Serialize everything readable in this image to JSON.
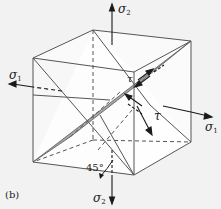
{
  "figure": {
    "panel_label": "(b)",
    "colors": {
      "background": "#f2f2f2",
      "edges": "#555555",
      "shaded_plane": "#a6a6a6",
      "face_light": "#ffffff"
    }
  },
  "labels": {
    "sigma2_top": {
      "symbol": "σ",
      "sub": "2"
    },
    "sigma1_left": {
      "symbol": "σ",
      "sub": "1"
    },
    "sigma1_right": {
      "symbol": "σ",
      "sub": "1"
    },
    "sigma2_bottom": {
      "symbol": "σ",
      "sub": "2"
    },
    "tau_upper": "τ",
    "tau_lower": "τ",
    "angle": "45°"
  }
}
